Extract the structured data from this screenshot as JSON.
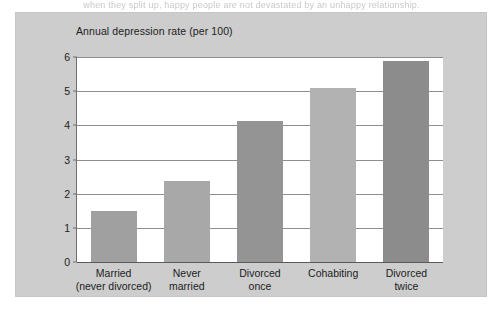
{
  "page": {
    "top_text_sliver": "when they split up, happy people are not devastated by an unhappy relationship."
  },
  "figure": {
    "panel_color": "#cdcdcd",
    "plot_background": "#ffffff",
    "axis_color": "#6e6e6e",
    "gridline_color": "#8e8e8e",
    "text_color": "#1c1c1c"
  },
  "chart_data": {
    "type": "bar",
    "title": "Annual depression rate (per 100)",
    "xlabel": "",
    "ylabel": "Annual depression rate (per 100)",
    "ylim": [
      0,
      6
    ],
    "ytick_step": 1,
    "ytick_labels": [
      "0",
      "1",
      "2",
      "3",
      "4",
      "5",
      "6"
    ],
    "grid": true,
    "legend": false,
    "categories": [
      "Married (never divorced)",
      "Never married",
      "Divorced once",
      "Cohabiting",
      "Divorced twice"
    ],
    "category_lines": [
      [
        "Married",
        "(never divorced)"
      ],
      [
        "Never",
        "married"
      ],
      [
        "Divorced",
        "once"
      ],
      [
        "Cohabiting",
        ""
      ],
      [
        "Divorced",
        "twice"
      ]
    ],
    "values": [
      1.49,
      2.38,
      4.12,
      5.09,
      5.88
    ],
    "bar_colors": [
      "#a0a0a0",
      "#a8a8a8",
      "#949494",
      "#b2b2b2",
      "#8c8c8c"
    ]
  }
}
